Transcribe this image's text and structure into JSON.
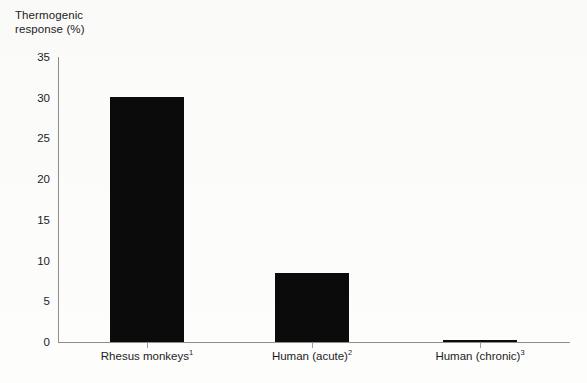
{
  "chart_data": {
    "type": "bar",
    "title": "",
    "ylabel": "Thermogenic\nresponse (%)",
    "xlabel": "",
    "categories": [
      "Rhesus monkeys",
      "Human (acute)",
      "Human (chronic)"
    ],
    "category_footnotes": [
      "1",
      "2",
      "3"
    ],
    "values": [
      30.1,
      8.5,
      0.2
    ],
    "ylim": [
      0,
      35
    ],
    "yticks": [
      0,
      5,
      10,
      15,
      20,
      25,
      30,
      35
    ],
    "ytick_labels": [
      "0",
      "5",
      "10",
      "15",
      "20",
      "25",
      "30",
      "35"
    ],
    "grid": false,
    "legend": false,
    "bar_color": "#0b0b0b",
    "axis_color": "#8d8d8d",
    "background_color": "#fdfdfc"
  }
}
